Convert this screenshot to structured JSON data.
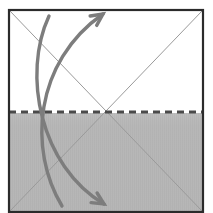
{
  "figure": {
    "type": "origami-fold-instruction",
    "canvas": {
      "width": 213,
      "height": 213,
      "background": "#ffffff"
    }
  },
  "sheet": {
    "name": "paper-square",
    "left": 9,
    "top": 10,
    "right": 203,
    "bottom": 212,
    "border_color": "#2b2b2b",
    "border_width": 2.2,
    "fill_color": "#ffffff"
  },
  "shaded_region": {
    "name": "lower-half-shading",
    "label": "back side of paper (shaded)",
    "left": 9,
    "top": 113,
    "right": 203,
    "bottom": 212,
    "fill_color": "#b6b6b6",
    "stripe_color": "#b0b0b0",
    "stripe_period": 2
  },
  "crease_lines": [
    {
      "name": "diagonal-crease-tl-br",
      "style": "solid",
      "color": "#9a9a9a",
      "width": 1,
      "x1": 10,
      "y1": 11,
      "x2": 202,
      "y2": 211
    },
    {
      "name": "diagonal-crease-bl-tr",
      "style": "solid",
      "color": "#9a9a9a",
      "width": 1,
      "x1": 10,
      "y1": 211,
      "x2": 202,
      "y2": 11
    }
  ],
  "fold_line": {
    "name": "horizontal-valley-fold",
    "style": "dashed",
    "color": "#4a4a4a",
    "width": 3,
    "dash": "7 5",
    "x1": 9,
    "y1": 112,
    "x2": 203,
    "y2": 112
  },
  "center_point": {
    "name": "crease-intersection",
    "x": 106,
    "y": 112
  },
  "arrows": [
    {
      "name": "fold-up-arrow",
      "direction": "up",
      "color": "#7d7d7d",
      "width": 3.4,
      "path": "M 62 206 C 28 150, 34 62, 103 14",
      "head": {
        "x": 103,
        "y": 14,
        "angle": -35
      },
      "head_size": 13
    },
    {
      "name": "unfold-down-arrow",
      "direction": "down",
      "color": "#7d7d7d",
      "width": 3.4,
      "path": "M 49 16 C 22 74, 40 166, 104 204",
      "head": {
        "x": 104,
        "y": 204,
        "angle": 32
      },
      "head_size": 13
    }
  ]
}
